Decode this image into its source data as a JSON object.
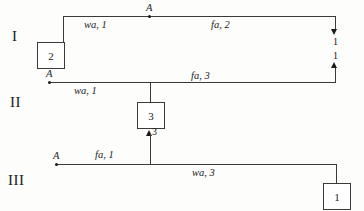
{
  "diagram": {
    "rows": [
      {
        "id": "row-1",
        "roman": "I",
        "node_label": "A",
        "segments": [
          {
            "label": "wa, 1"
          },
          {
            "label": "fa, 2"
          }
        ],
        "box": {
          "value": "2"
        },
        "arrows": [
          {
            "direction": "down",
            "label": "1"
          },
          {
            "direction": "up",
            "label": "1"
          }
        ]
      },
      {
        "id": "row-2",
        "roman": "II",
        "node_label": "A",
        "segments": [
          {
            "label": "wa, 1"
          },
          {
            "label": "fa, 3"
          }
        ],
        "box": {
          "value": "3"
        },
        "arrows": [
          {
            "direction": "up",
            "label": "3"
          }
        ]
      },
      {
        "id": "row-3",
        "roman": "III",
        "node_label": "A",
        "segments": [
          {
            "label": "fa, 1"
          },
          {
            "label": "wa, 3"
          }
        ],
        "box": {
          "value": "1"
        },
        "arrows": []
      }
    ]
  },
  "colors": {
    "ink": "#1a1a1a",
    "line": "#3a3a3a",
    "paper": "#fdfdfc"
  }
}
